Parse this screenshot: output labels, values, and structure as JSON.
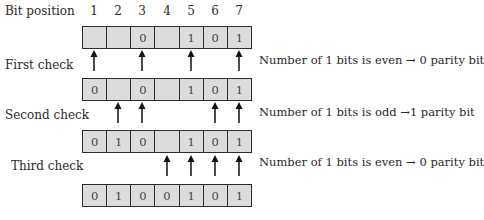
{
  "header": {
    "bit_position_label": "Bit position",
    "positions": [
      "1",
      "2",
      "3",
      "4",
      "5",
      "6",
      "7"
    ]
  },
  "rows": [
    {
      "bits": [
        "",
        "",
        "0",
        "",
        "1",
        "0",
        "1"
      ]
    },
    {
      "bits": [
        "0",
        "",
        "0",
        "",
        "1",
        "0",
        "1"
      ]
    },
    {
      "bits": [
        "0",
        "1",
        "0",
        "",
        "1",
        "0",
        "1"
      ]
    },
    {
      "bits": [
        "0",
        "1",
        "0",
        "0",
        "1",
        "0",
        "1"
      ]
    }
  ],
  "checks": [
    {
      "label": "First check",
      "arrow_positions": [
        1,
        3,
        5,
        7
      ],
      "result": "Number of 1 bits is even → 0 parity bit"
    },
    {
      "label": "Second check",
      "arrow_positions": [
        2,
        3,
        6,
        7
      ],
      "result": "Number of 1 bits is odd →1 parity bit"
    },
    {
      "label": "Third check",
      "arrow_positions": [
        4,
        5,
        6,
        7
      ],
      "result": "Number of 1 bits is even → 0 parity bit"
    }
  ],
  "colors": {
    "cell_fill": "#dcdcdc",
    "border": "#2b2b2b"
  }
}
